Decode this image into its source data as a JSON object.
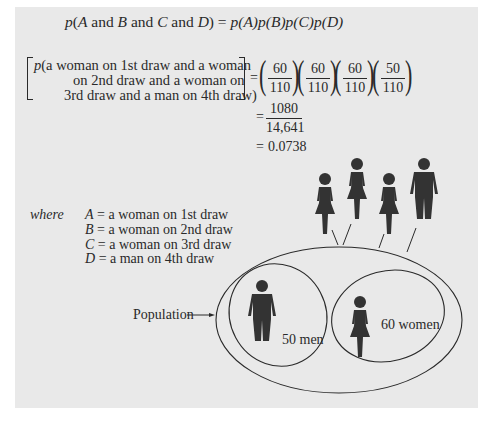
{
  "equation": {
    "general_rule": {
      "lhs_p": "p(",
      "A": "A",
      "and1": " and ",
      "B": "B",
      "and2": " and ",
      "C": "C",
      "and3": " and ",
      "D": "D",
      "close": ") = ",
      "rhs": "p(A)p(B)p(C)p(D)"
    },
    "specific": {
      "line1": "p(a woman on 1st draw and a woman",
      "line2": "on 2nd draw and a woman on",
      "line3": "3rd draw and a man on 4th draw)",
      "equals": "=",
      "fractions": [
        {
          "num": "60",
          "den": "110"
        },
        {
          "num": "60",
          "den": "110"
        },
        {
          "num": "60",
          "den": "110"
        },
        {
          "num": "50",
          "den": "110"
        }
      ]
    },
    "step2": {
      "equals": "=",
      "num": "1080",
      "den": "14,641"
    },
    "step3": {
      "equals": "=",
      "value": "0.0738"
    }
  },
  "legend": {
    "where_label": "where",
    "items": [
      {
        "var": "A",
        "text": "= a woman on 1st draw"
      },
      {
        "var": "B",
        "text": "= a woman on 2nd draw"
      },
      {
        "var": "C",
        "text": "= a woman on 3rd draw"
      },
      {
        "var": "D",
        "text": "= a man on 4th draw"
      }
    ]
  },
  "diagram": {
    "population_label": "Population",
    "men_label": "50 men",
    "women_label": "60 women",
    "drawn_sequence": [
      "woman-icon",
      "woman-icon",
      "woman-icon",
      "man-icon"
    ],
    "colors": {
      "panel": "#e9e9e9",
      "figure": "#333333",
      "line": "#2a2a2a"
    }
  }
}
